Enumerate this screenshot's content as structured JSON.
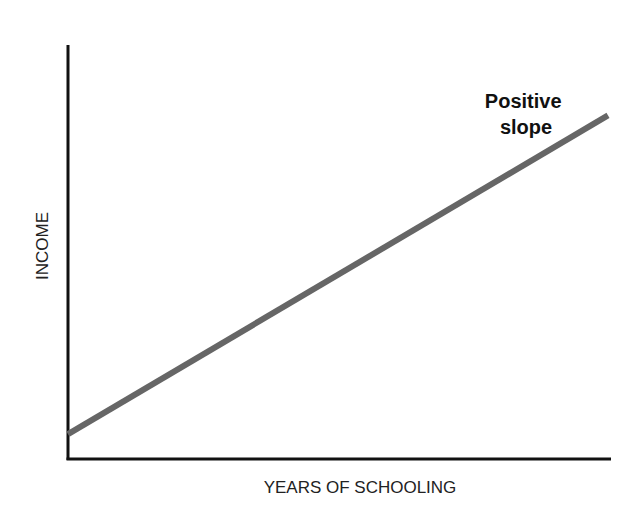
{
  "chart_data": {
    "type": "line",
    "title": "",
    "xlabel": "YEARS OF SCHOOLING",
    "ylabel": "INCOME",
    "x": [
      0,
      1
    ],
    "series": [
      {
        "name": "Positive slope",
        "values": [
          0.06,
          0.83
        ],
        "color": "#666666"
      }
    ],
    "xlim": [
      0,
      1
    ],
    "ylim": [
      0,
      1
    ],
    "grid": false,
    "ticks": false,
    "legend": "none",
    "annotations": [
      {
        "text_line1": "Positive",
        "text_line2": "slope",
        "x": 0.84,
        "y": 0.87
      }
    ]
  },
  "colors": {
    "axis": "#111111",
    "line": "#666666",
    "background": "#ffffff"
  }
}
